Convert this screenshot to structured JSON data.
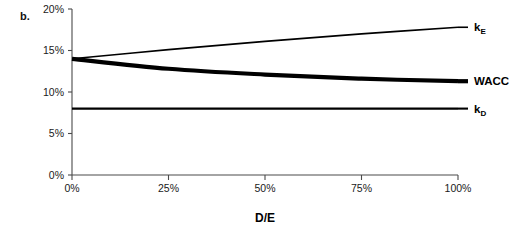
{
  "figure": {
    "panel_label": "b."
  },
  "chart_data": {
    "type": "line",
    "title": "",
    "subtitle": "",
    "xlabel": "D/E",
    "ylabel": "",
    "xlim": [
      0,
      100
    ],
    "ylim": [
      0,
      20
    ],
    "grid": false,
    "legend_position": "right-of-plot (inline series labels)",
    "x_unit": "%",
    "y_unit": "%",
    "x_tick_labels": [
      "0%",
      "25%",
      "50%",
      "75%",
      "100%"
    ],
    "x_tick_values": [
      0,
      25,
      50,
      75,
      100
    ],
    "y_tick_labels": [
      "0%",
      "5%",
      "10%",
      "15%",
      "20%"
    ],
    "y_tick_values": [
      0,
      5,
      10,
      15,
      20
    ],
    "x": [
      0,
      25,
      50,
      75,
      100
    ],
    "series": [
      {
        "name": "kE",
        "label_text": "k",
        "label_sub": "E",
        "values": [
          14.0,
          15.1,
          16.1,
          17.0,
          17.8
        ],
        "line_width": 1.6,
        "color": "#000000",
        "annotation_value": "17.8%"
      },
      {
        "name": "WACC",
        "label_text": "WACC",
        "label_sub": "",
        "values": [
          14.0,
          12.8,
          12.1,
          11.6,
          11.3
        ],
        "line_width": 4.2,
        "color": "#000000",
        "annotation_value": "11.3%"
      },
      {
        "name": "kD",
        "label_text": "k",
        "label_sub": "D",
        "values": [
          8.0,
          8.0,
          8.0,
          8.0,
          8.0
        ],
        "line_width": 2.1,
        "color": "#000000",
        "annotation_value": "8.0%"
      }
    ]
  }
}
